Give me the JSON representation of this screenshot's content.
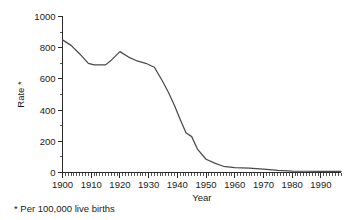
{
  "chart_data": {
    "type": "line",
    "title": "",
    "xlabel": "Year",
    "ylabel": "Rate *",
    "xlim": [
      1900,
      1997
    ],
    "ylim": [
      0,
      1000
    ],
    "grid": false,
    "legend": null,
    "x_ticks": [
      1900,
      1910,
      1920,
      1930,
      1940,
      1950,
      1960,
      1970,
      1980,
      1990
    ],
    "x_tick_labels": [
      "1900",
      "1910",
      "1920",
      "1930",
      "1940",
      "1950",
      "1960",
      "1970",
      "1980",
      "1990"
    ],
    "x_minor_tick_step": 1,
    "y_ticks": [
      0,
      200,
      400,
      600,
      800,
      1000
    ],
    "y_tick_labels": [
      "0",
      "200",
      "400",
      "600",
      "800",
      "1000"
    ],
    "y_minor_tick_step": 100,
    "series": [
      {
        "name": "Maternal mortality rate",
        "color": "#4a4a4a",
        "x": [
          1900,
          1903,
          1906,
          1909,
          1911,
          1913,
          1915,
          1917,
          1920,
          1923,
          1926,
          1929,
          1932,
          1935,
          1937,
          1939,
          1941,
          1943,
          1945,
          1947,
          1950,
          1953,
          1956,
          1960,
          1965,
          1970,
          1975,
          1980,
          1985,
          1990,
          1997
        ],
        "values": [
          850,
          815,
          760,
          700,
          690,
          690,
          690,
          720,
          775,
          740,
          715,
          700,
          675,
          580,
          510,
          430,
          340,
          255,
          230,
          150,
          85,
          60,
          40,
          32,
          28,
          22,
          13,
          9,
          8,
          8,
          7
        ]
      }
    ],
    "annotations": [
      "* Per 100,000 live births"
    ]
  },
  "footnote": {
    "marker": "*",
    "text": "Per 100,000 live births",
    "full": "* Per 100,000 live births"
  },
  "axes": {
    "y_title": "Rate *",
    "x_title": "Year"
  }
}
